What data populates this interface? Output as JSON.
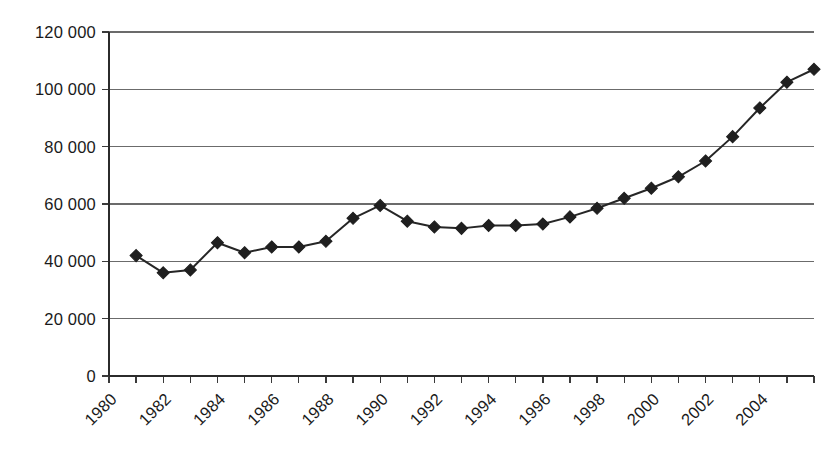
{
  "chart_data": {
    "type": "line",
    "title": "",
    "subtitle": "",
    "xlabel": "",
    "ylabel": "",
    "grid": true,
    "legend": false,
    "legend_position": "none",
    "marker": "diamond",
    "line_color": "#262626",
    "marker_color": "#1f1f1f",
    "grid_color": "#6b6b6b",
    "axis_color": "#2b2b2b",
    "background": "#ffffff",
    "xlim": [
      1980,
      2006
    ],
    "ylim": [
      0,
      120000
    ],
    "ytick_values": [
      0,
      20000,
      40000,
      60000,
      80000,
      100000,
      120000
    ],
    "ytick_labels": [
      "0",
      "20 000",
      "40 000",
      "60 000",
      "80 000",
      "100 000",
      "120 000"
    ],
    "xtick_labels": [
      "1980",
      "1982",
      "1984",
      "1986",
      "1988",
      "1990",
      "1992",
      "1994",
      "1996",
      "1998",
      "2000",
      "2002",
      "2004"
    ],
    "xtick_label_rotation": 45,
    "xtick_label_step_years": 2,
    "xtick_minor_step_years": 1,
    "x": [
      1981,
      1982,
      1983,
      1984,
      1985,
      1986,
      1987,
      1988,
      1989,
      1990,
      1991,
      1992,
      1993,
      1994,
      1995,
      1996,
      1997,
      1998,
      1999,
      2000,
      2001,
      2002,
      2003,
      2004,
      2005
    ],
    "values": [
      42000,
      36000,
      37000,
      46500,
      43000,
      45000,
      45000,
      47000,
      55000,
      59500,
      54000,
      52000,
      51500,
      52500,
      52500,
      53000,
      55500,
      58500,
      62000,
      65500,
      69500,
      75000,
      83500,
      93500,
      102500
    ],
    "values_extra_final": 107000,
    "series": [
      {
        "name": "series-1",
        "x": [
          1981,
          1982,
          1983,
          1984,
          1985,
          1986,
          1987,
          1988,
          1989,
          1990,
          1991,
          1992,
          1993,
          1994,
          1995,
          1996,
          1997,
          1998,
          1999,
          2000,
          2001,
          2002,
          2003,
          2004,
          2005,
          2006
        ],
        "values": [
          42000,
          36000,
          37000,
          46500,
          43000,
          45000,
          45000,
          47000,
          55000,
          59500,
          54000,
          52000,
          51500,
          52500,
          52500,
          53000,
          55500,
          58500,
          62000,
          65500,
          69500,
          75000,
          83500,
          93500,
          102500,
          107000
        ]
      }
    ]
  },
  "geometry": {
    "plot_left": 109,
    "plot_right": 814,
    "plot_top": 32,
    "plot_bottom": 376,
    "marker_half": 6.0,
    "tick_len": 7
  }
}
